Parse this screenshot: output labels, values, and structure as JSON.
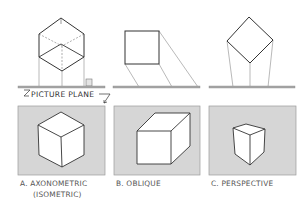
{
  "figure": {
    "picture_plane_label": "PICTURE PLANE",
    "views": [
      {
        "id": "A",
        "caption_line1": "A. AXONOMETRIC",
        "caption_line2": "(ISOMETRIC)",
        "projection": "parallel, perpendicular to plane, object rotated"
      },
      {
        "id": "B",
        "caption_line1": "B. OBLIQUE",
        "caption_line2": "",
        "projection": "parallel, oblique to plane"
      },
      {
        "id": "C",
        "caption_line1": "C. PERSPECTIVE",
        "caption_line2": "",
        "projection": "converging"
      }
    ],
    "colors": {
      "panel_fill": "#d6d6d6",
      "panel_border": "#9a9a9a",
      "line": "#333333",
      "projector": "#8a8a8a",
      "plane_line": "#a8a8a8",
      "cube_face": "#ffffff"
    }
  }
}
